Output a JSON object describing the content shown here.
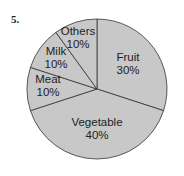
{
  "question_number": "5.",
  "chart_data": {
    "type": "pie",
    "title": "",
    "categories": [
      "Fruit",
      "Vegetable",
      "Meat",
      "Milk",
      "Others"
    ],
    "values": [
      30,
      40,
      10,
      10,
      10
    ],
    "labels": [
      {
        "name": "Fruit",
        "pct": "30%"
      },
      {
        "name": "Vegetable",
        "pct": "40%"
      },
      {
        "name": "Meat",
        "pct": "10%"
      },
      {
        "name": "Milk",
        "pct": "10%"
      },
      {
        "name": "Others",
        "pct": "10%"
      }
    ],
    "start_angle": "12 o'clock",
    "direction": "clockwise",
    "fill_color": "#c8c8c8",
    "edge_color": "#333333",
    "legend": "none"
  }
}
